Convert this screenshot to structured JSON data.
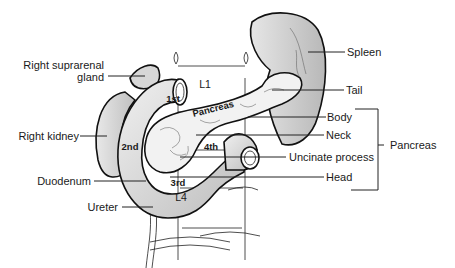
{
  "figure": {
    "type": "anatomical-diagram"
  },
  "labels": {
    "right_suprarenal_gland": "Right suprarenal gland",
    "right_suprarenal_gland_line1": "Right suprarenal",
    "right_suprarenal_gland_line2": "gland",
    "right_kidney": "Right kidney",
    "duodenum": "Duodenum",
    "ureter": "Ureter",
    "spleen": "Spleen",
    "tail": "Tail",
    "body": "Body",
    "neck": "Neck",
    "uncinate_process": "Uncinate process",
    "head": "Head",
    "pancreas_group": "Pancreas"
  },
  "inline_labels": {
    "duodenum_parts": [
      "1st",
      "2nd",
      "3rd",
      "4th"
    ],
    "pancreas": "Pancreas",
    "vertebra_top": "L1",
    "vertebra_bottom": "L4"
  },
  "bracket": {
    "label": "Pancreas",
    "groups": [
      "Body",
      "Neck",
      "Uncinate process",
      "Head"
    ]
  },
  "colors": {
    "background": "#ffffff",
    "organ_fill": "#cfcfcf",
    "organ_fill_light": "#e4e4e4",
    "pancreas_fill": "#f2f2f2",
    "line": "#111111"
  }
}
